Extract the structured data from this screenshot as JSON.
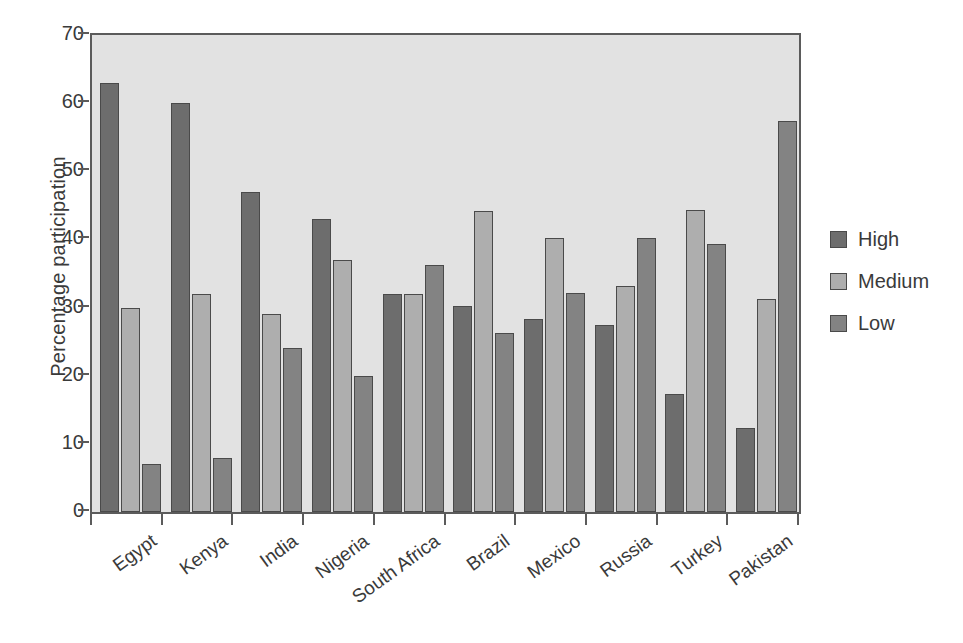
{
  "chart_data": {
    "type": "bar",
    "title": "",
    "xlabel": "",
    "ylabel": "Percentage participation",
    "ylim": [
      0,
      70
    ],
    "yticks": [
      0,
      10,
      20,
      30,
      40,
      50,
      60,
      70
    ],
    "grid": false,
    "legend_position": "right",
    "categories": [
      "Egypt",
      "Kenya",
      "India",
      "Nigeria",
      "South Africa",
      "Brazil",
      "Mexico",
      "Russia",
      "Turkey",
      "Pakistan"
    ],
    "series": [
      {
        "name": "High",
        "color": "#6d6d6d",
        "values": [
          63,
          60,
          47,
          43,
          32,
          30.2,
          28.3,
          27.4,
          17.3,
          12.3
        ]
      },
      {
        "name": "Medium",
        "color": "#aeaeae",
        "values": [
          30,
          32,
          29,
          37,
          32,
          44.2,
          40.2,
          33.2,
          44.3,
          31.3
        ]
      },
      {
        "name": "Low",
        "color": "#838383",
        "values": [
          7,
          8,
          24,
          20,
          36.2,
          26.2,
          32.2,
          40.2,
          39.3,
          57.4
        ]
      }
    ]
  },
  "legend": {
    "items": [
      {
        "label": "High",
        "color": "#6d6d6d"
      },
      {
        "label": "Medium",
        "color": "#aeaeae"
      },
      {
        "label": "Low",
        "color": "#838383"
      }
    ]
  },
  "axis": {
    "y_title": "Percentage participation",
    "y_tick_labels": [
      "70",
      "60",
      "50",
      "40",
      "30",
      "20",
      "10",
      "0"
    ]
  },
  "colors": {
    "plot_background": "#e2e2e2",
    "axis_line": "#5b5b5b",
    "text": "#3a3a3a",
    "page_background": "#ffffff"
  }
}
